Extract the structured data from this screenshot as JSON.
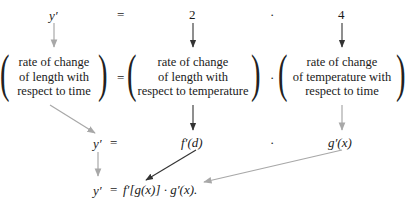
{
  "row1": {
    "lhs": "y′",
    "eq": "=",
    "factor1": "2",
    "dot": "·",
    "factor2": "4"
  },
  "row2": {
    "box1": [
      "rate of change",
      "of length with",
      "respect to time"
    ],
    "eq": "=",
    "box2": [
      "rate of change",
      "of length with",
      "respect to temperature"
    ],
    "dot": "·",
    "box3": [
      "rate of change",
      "of temperature with",
      "respect to time"
    ]
  },
  "row3": {
    "lhs": "y′",
    "eq": "=",
    "factor1": "f′(d)",
    "dot": "·",
    "factor2": "g′(x)"
  },
  "row4": {
    "formula_lhs": "y′",
    "formula_eq": "=",
    "formula_rhs": "f′[g(x)] · g′(x)."
  },
  "colors": {
    "dark_arrow": "#333333",
    "light_arrow": "#a8a8a8"
  }
}
